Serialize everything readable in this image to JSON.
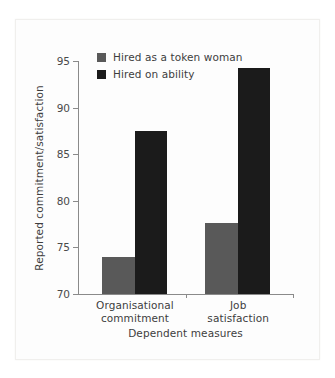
{
  "chart_data": {
    "type": "bar",
    "title": "",
    "xlabel": "Dependent measures",
    "ylabel": "Reported commitment/satisfaction",
    "categories": [
      "Organisational commitment",
      "Job satisfaction"
    ],
    "category_lines": [
      [
        "Organisational",
        "commitment"
      ],
      [
        "Job",
        "satisfaction"
      ]
    ],
    "ylim": [
      70,
      95
    ],
    "yticks": [
      70,
      75,
      80,
      85,
      90,
      95
    ],
    "ytick_labels": [
      "70",
      "75",
      "80",
      "85",
      "90",
      "95"
    ],
    "grid": false,
    "legend_position": "top-left-inside",
    "series": [
      {
        "name": "Hired as a token woman",
        "color": "#595959",
        "values": [
          74.0,
          77.6
        ]
      },
      {
        "name": "Hired on ability",
        "color": "#1b1b1b",
        "values": [
          87.5,
          94.2
        ]
      }
    ]
  },
  "legend": {
    "items": [
      {
        "label": "Hired as a token woman",
        "color": "#595959"
      },
      {
        "label": "Hired on ability",
        "color": "#1b1b1b"
      }
    ]
  },
  "colors": {
    "axis": "#8a8a8a",
    "text": "#3d3d3d",
    "tick_text": "#4a4a4a",
    "background": "#ffffff",
    "card": "#fdfdfd"
  }
}
